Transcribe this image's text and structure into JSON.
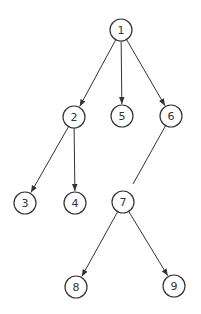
{
  "diagram": {
    "type": "tree",
    "colors": {
      "stroke": "#333333",
      "background": "#ffffff"
    },
    "nodes": [
      {
        "id": "1",
        "label": "1",
        "x": 121,
        "y": 30
      },
      {
        "id": "2",
        "label": "2",
        "x": 74,
        "y": 117
      },
      {
        "id": "5",
        "label": "5",
        "x": 122,
        "y": 116
      },
      {
        "id": "6",
        "label": "6",
        "x": 171,
        "y": 116
      },
      {
        "id": "3",
        "label": "3",
        "x": 25,
        "y": 203
      },
      {
        "id": "4",
        "label": "4",
        "x": 75,
        "y": 203
      },
      {
        "id": "7",
        "label": "7",
        "x": 123,
        "y": 202
      },
      {
        "id": "8",
        "label": "8",
        "x": 76,
        "y": 287
      },
      {
        "id": "9",
        "label": "9",
        "x": 174,
        "y": 286
      }
    ],
    "edges": [
      {
        "from": "1",
        "to": "2",
        "arrow": true
      },
      {
        "from": "1",
        "to": "5",
        "arrow": true
      },
      {
        "from": "1",
        "to": "6",
        "arrow": true
      },
      {
        "from": "2",
        "to": "3",
        "arrow": true
      },
      {
        "from": "2",
        "to": "4",
        "arrow": true
      },
      {
        "from": "6",
        "to": "7",
        "arrow": false,
        "broken": true
      },
      {
        "from": "7",
        "to": "8",
        "arrow": true
      },
      {
        "from": "7",
        "to": "9",
        "arrow": true
      }
    ]
  }
}
